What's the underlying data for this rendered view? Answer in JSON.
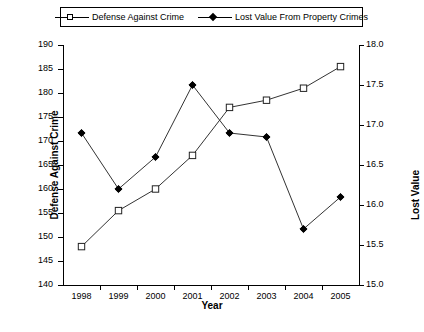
{
  "legend": {
    "entries": [
      {
        "label": "Defense Against Crime",
        "marker": "open-square-marker-icon"
      },
      {
        "label": "Lost Value From Property Crimes",
        "marker": "filled-diamond-marker-icon"
      }
    ]
  },
  "axes": {
    "left_title": "Defense Against Crime",
    "right_title": "Lost Value",
    "x_title": "Year"
  },
  "caption": "",
  "chart_data": {
    "type": "line",
    "title": "",
    "xlabel": "Year",
    "ylabel": "Defense Against Crime",
    "y2label": "Lost Value",
    "categories": [
      "1998",
      "1999",
      "2000",
      "2001",
      "2002",
      "2003",
      "2004",
      "2005"
    ],
    "x_tick_labels": [
      "1998",
      "1999",
      "2000",
      "2001",
      "2002",
      "2003",
      "2004",
      "2005"
    ],
    "ylim": [
      140,
      190
    ],
    "y_tick_labels": [
      "140",
      "145",
      "150",
      "155",
      "160",
      "165",
      "170",
      "175",
      "180",
      "185",
      "190"
    ],
    "y2lim": [
      15.0,
      18.0
    ],
    "y2_tick_labels": [
      "15.0",
      "15.5",
      "16.0",
      "16.5",
      "17.0",
      "17.5",
      "18.0"
    ],
    "grid": false,
    "legend_position": "top",
    "series": [
      {
        "name": "Defense Against Crime",
        "axis": "left",
        "marker": "open-square",
        "values": [
          148.0,
          155.5,
          160.0,
          167.0,
          177.0,
          178.5,
          181.0,
          185.5
        ]
      },
      {
        "name": "Lost Value From Property Crimes",
        "axis": "right",
        "marker": "filled-diamond",
        "values": [
          16.9,
          16.2,
          16.6,
          17.5,
          16.9,
          16.85,
          15.7,
          16.1
        ]
      }
    ]
  }
}
